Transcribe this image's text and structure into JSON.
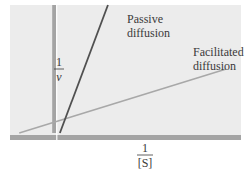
{
  "chart_data": {
    "type": "line",
    "title": "",
    "xlabel_numerator": "1",
    "xlabel_denominator": "[S]",
    "ylabel_numerator": "1",
    "ylabel_denominator": "v",
    "xlim": [
      -0.25,
      1.0
    ],
    "ylim": [
      0,
      1.0
    ],
    "grid": false,
    "legend": "inline-labels",
    "series": [
      {
        "name": "Passive diffusion",
        "label_lines": [
          "Passive",
          "diffusion"
        ],
        "color": "#505050",
        "points": [
          [
            0.02,
            0.0
          ],
          [
            0.28,
            1.0
          ]
        ]
      },
      {
        "name": "Facilitated diffusion",
        "label_lines": [
          "Facilitated",
          "diffusion"
        ],
        "color": "#a8a8a8",
        "points": [
          [
            -0.2,
            0.0
          ],
          [
            0.92,
            0.5
          ]
        ]
      }
    ]
  },
  "colors": {
    "panel": "#ececec",
    "axis": "#a4a4a4"
  }
}
